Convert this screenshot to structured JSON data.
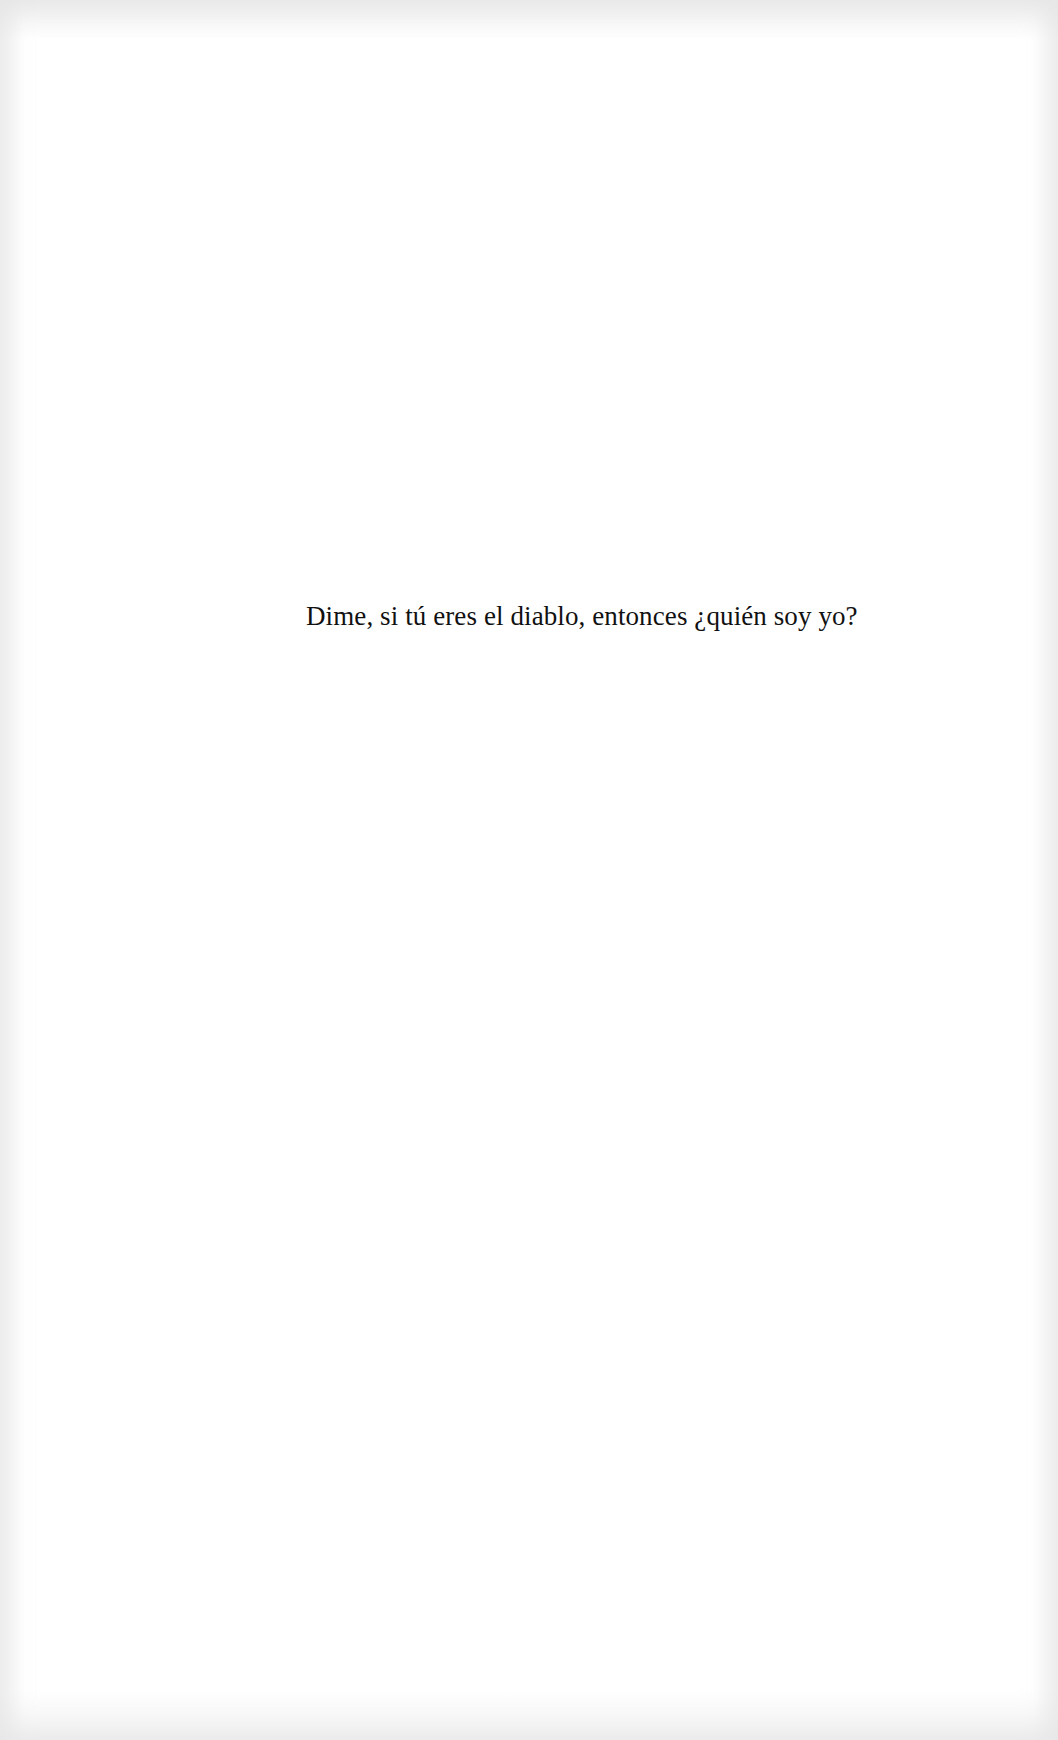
{
  "page": {
    "background_color": "#ffffff",
    "text_color": "#111111"
  },
  "epigraph": {
    "text": "Dime, si tú eres el diablo, entonces ¿quién soy yo?"
  }
}
